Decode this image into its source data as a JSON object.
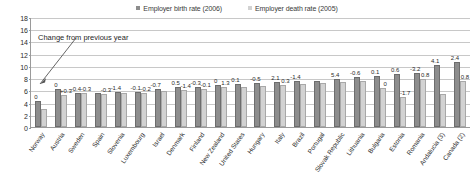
{
  "chart_data": {
    "type": "bar",
    "title": "",
    "xlabel": "",
    "ylabel": "",
    "ylim": [
      0,
      18
    ],
    "yticks": [
      0,
      2,
      4,
      6,
      8,
      10,
      12,
      14,
      16,
      18
    ],
    "grid": true,
    "legend_position": "top-center",
    "annotation": "Change from previous year",
    "categories": [
      "Norway",
      "Austria",
      "Sweden",
      "Spain",
      "Slovenia",
      "Luxembourg",
      "Israel",
      "Denmark",
      "Finland",
      "New Zealand",
      "United States",
      "Hungary",
      "Italy",
      "Brazil",
      "Portugal",
      "Slovak Republic",
      "Lithuania",
      "Bulgaria",
      "Estonia",
      "Romania",
      "Andalucia (3)",
      "Canada (2)"
    ],
    "series": [
      {
        "name": "Employer birth rate (2006)",
        "color": "#8d8d8d",
        "values": [
          4.2,
          6.2,
          5.6,
          5.6,
          5.8,
          5.8,
          6.3,
          6.5,
          6.6,
          6.9,
          7.0,
          7.2,
          7.4,
          7.5,
          7.6,
          7.8,
          8.2,
          8.4,
          8.6,
          8.8,
          10.2,
          10.6
        ]
      },
      {
        "name": "Employer death rate (2005)",
        "color": "#d2d2d2",
        "values": [
          3.0,
          5.2,
          5.6,
          5.4,
          5.6,
          5.6,
          5.9,
          6.0,
          6.2,
          6.5,
          6.5,
          6.7,
          6.9,
          7.0,
          7.2,
          7.4,
          7.6,
          6.4,
          4.9,
          7.9,
          5.4,
          7.5
        ]
      }
    ],
    "change_labels": [
      {
        "category": "Norway",
        "birth": "0",
        "death": ""
      },
      {
        "category": "Austria",
        "birth": "0",
        "death": "+0.3"
      },
      {
        "category": "Sweden",
        "birth": "-0.4",
        "death": "-0.3"
      },
      {
        "category": "Spain",
        "birth": "",
        "death": "-0.3"
      },
      {
        "category": "Slovenia",
        "birth": "-1.4",
        "death": ""
      },
      {
        "category": "Luxembourg",
        "birth": "-0.1",
        "death": "-0.2"
      },
      {
        "category": "Israel",
        "birth": "-0.7",
        "death": ""
      },
      {
        "category": "Denmark",
        "birth": "0.5",
        "death": "-1.4"
      },
      {
        "category": "Finland",
        "birth": "-0.3",
        "death": "-0.1"
      },
      {
        "category": "New Zealand",
        "birth": "0",
        "death": "1.3"
      },
      {
        "category": "United States",
        "birth": "0.1",
        "death": ""
      },
      {
        "category": "Hungary",
        "birth": "-0.5",
        "death": ""
      },
      {
        "category": "Italy",
        "birth": "2.1",
        "death": "0.3"
      },
      {
        "category": "Brazil",
        "birth": "-1.4",
        "death": ""
      },
      {
        "category": "Portugal",
        "birth": "",
        "death": ""
      },
      {
        "category": "Slovak Republic",
        "birth": "5.4",
        "death": ""
      },
      {
        "category": "Lithuania",
        "birth": "-0.6",
        "death": ""
      },
      {
        "category": "Bulgaria",
        "birth": "0.1",
        "death": "0"
      },
      {
        "category": "Estonia",
        "birth": "0.6",
        "death": "-1.7"
      },
      {
        "category": "Romania",
        "birth": "-3.2",
        "death": "0.8"
      },
      {
        "category": "Andalucia (3)",
        "birth": "4.1",
        "death": ""
      },
      {
        "category": "Canada (2)",
        "birth": "2.4",
        "death": "0.8"
      }
    ]
  }
}
